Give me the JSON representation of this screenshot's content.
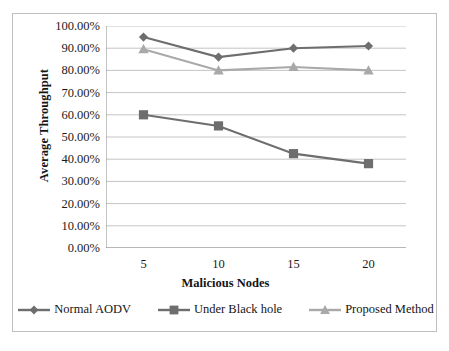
{
  "chart_data": {
    "type": "line",
    "title": "",
    "xlabel": "Malicious Nodes",
    "ylabel": "Average Throughput",
    "categories": [
      "5",
      "10",
      "15",
      "20"
    ],
    "x": [
      5,
      10,
      15,
      20
    ],
    "ylim": [
      0,
      100
    ],
    "ytick_step": 10,
    "ytick_labels": [
      "0.00%",
      "10.00%",
      "20.00%",
      "30.00%",
      "40.00%",
      "50.00%",
      "60.00%",
      "70.00%",
      "80.00%",
      "90.00%",
      "100.00%"
    ],
    "ytick_values": [
      0,
      10,
      20,
      30,
      40,
      50,
      60,
      70,
      80,
      90,
      100
    ],
    "grid": "horizontal",
    "legend_position": "bottom",
    "value_unit": "percent",
    "series": [
      {
        "name": "Normal AODV",
        "marker": "diamond",
        "color": "#6e6e6e",
        "values": [
          95.0,
          86.0,
          90.0,
          91.0
        ]
      },
      {
        "name": "Under Black hole",
        "marker": "square",
        "color": "#6e6e6e",
        "values": [
          60.0,
          55.0,
          42.5,
          38.0
        ]
      },
      {
        "name": "Proposed Method",
        "marker": "triangle",
        "color": "#a9a9a9",
        "values": [
          89.5,
          80.0,
          81.5,
          80.0
        ]
      }
    ]
  },
  "style": {
    "grid_color": "#b5b5b5",
    "axis_color": "#8c8c8c",
    "frame_color": "#bfbfbf",
    "background": "#ffffff",
    "text_color": "#151515"
  }
}
